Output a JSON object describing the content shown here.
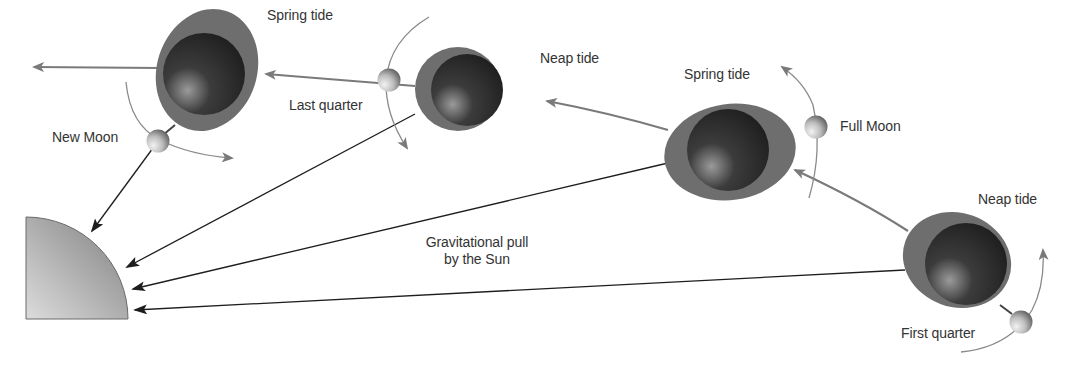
{
  "diagram": {
    "sun": {
      "label": "Sun",
      "icon": "sun-quarter-disc-icon"
    },
    "labels": {
      "spring_tide_1": "Spring tide",
      "new_moon": "New Moon",
      "last_quarter": "Last quarter",
      "neap_tide_1": "Neap tide",
      "spring_tide_2": "Spring tide",
      "full_moon": "Full Moon",
      "neap_tide_2": "Neap tide",
      "first_quarter": "First quarter",
      "gravity_line1": "Gravitational pull",
      "gravity_line2": "by the Sun"
    },
    "positions": [
      {
        "phase": "New Moon",
        "tide": "Spring tide"
      },
      {
        "phase": "Last quarter",
        "tide": "Neap tide"
      },
      {
        "phase": "Full Moon",
        "tide": "Spring tide"
      },
      {
        "phase": "First quarter",
        "tide": "Neap tide"
      }
    ],
    "colors": {
      "bulge": "#6e6e6e",
      "earth_dark": "#2a2a2a",
      "orbit_arrow": "#7a7a7a",
      "gravity_arrow": "#222222",
      "sun_light": "#d8d8d8",
      "sun_dark": "#8a8a8a",
      "text": "#333333"
    }
  }
}
